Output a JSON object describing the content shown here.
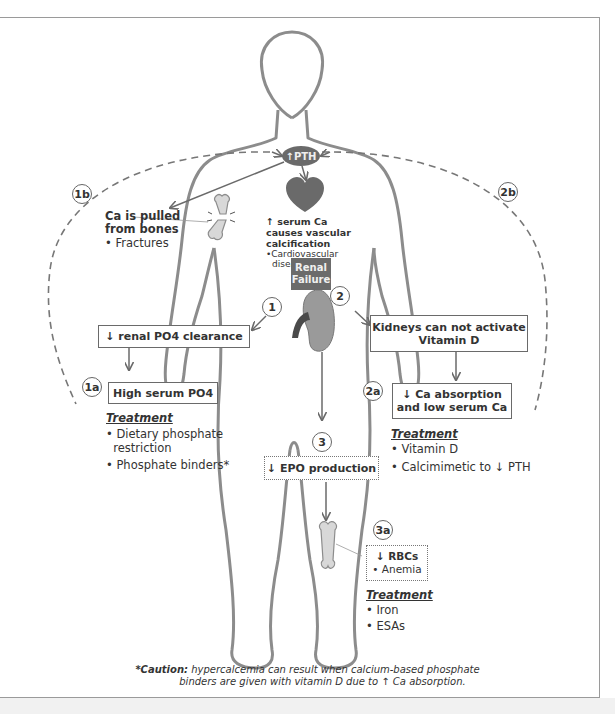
{
  "diagram": {
    "colors": {
      "outline": "#8c8c8c",
      "dark_fill": "#6a6a6a",
      "kidney_fill": "#9a9a9a",
      "bone_fill": "#d8d8d8",
      "text": "#333333"
    },
    "pth_label": "↑PTH",
    "renal_failure": [
      "Renal",
      "Failure"
    ],
    "heart_note": {
      "title_lines": [
        "↑ serum Ca",
        "causes vascular",
        "calcification"
      ],
      "bullets": [
        "•Cardiovascular",
        "disease"
      ]
    },
    "node_1b": {
      "badge": "1b",
      "title_lines": [
        "Ca is pulled",
        "from bones"
      ],
      "bullet": "• Fractures"
    },
    "node_2b": {
      "badge": "2b"
    },
    "pathway_1": {
      "badge": "1",
      "box": "↓ renal PO4 clearance",
      "sub_badge": "1a",
      "sub_box": "High serum PO4",
      "treatment_heading": "Treatment",
      "treatments": [
        "• Dietary phosphate",
        "  restriction",
        "• Phosphate binders*"
      ]
    },
    "pathway_2": {
      "badge": "2",
      "box_lines": [
        "Kidneys can not activate",
        "Vitamin D"
      ],
      "sub_badge": "2a",
      "sub_box_lines": [
        "↓ Ca absorption",
        "and low serum Ca"
      ],
      "treatment_heading": "Treatment",
      "treatments": [
        "• Vitamin D",
        "• Calcimimetic to ↓ PTH"
      ]
    },
    "pathway_3": {
      "badge": "3",
      "box": "↓ EPO production",
      "sub_badge": "3a",
      "sub_box_title": "↓ RBCs",
      "sub_box_bullet": "• Anemia",
      "treatment_heading": "Treatment",
      "treatments": [
        "• Iron",
        "• ESAs"
      ]
    },
    "caution": {
      "label": "*Caution:",
      "line1": " hypercalcemia can result when calcium-based phosphate",
      "line2": "binders are given with vitamin D due to ↑ Ca absorption."
    }
  }
}
